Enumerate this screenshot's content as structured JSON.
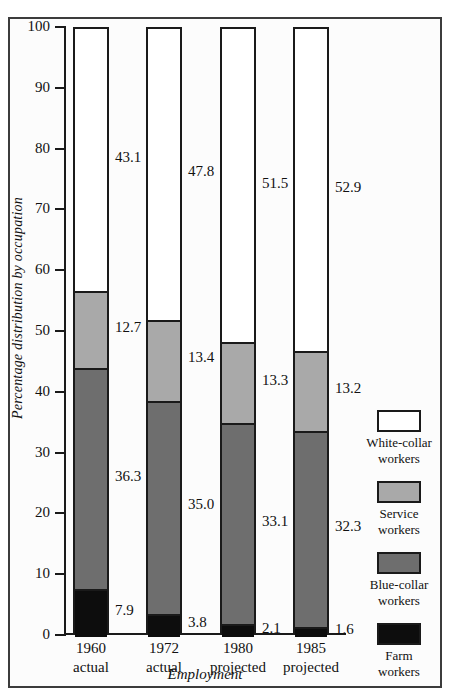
{
  "scan_artifact_text": "",
  "chart_data": {
    "type": "bar",
    "subtype": "stacked-100-percent",
    "title": "",
    "xlabel": "Employment",
    "ylabel": "Percentage distribution by occupation",
    "ylim": [
      0,
      100
    ],
    "ytick_labels": [
      "100",
      "90",
      "80",
      "70",
      "60",
      "50",
      "40",
      "30",
      "20",
      "10",
      "0"
    ],
    "ytick_values": [
      100,
      90,
      80,
      70,
      60,
      50,
      40,
      30,
      20,
      10,
      0
    ],
    "grid": false,
    "legend_position": "right",
    "categories": [
      "1960 actual",
      "1972 actual",
      "1980 projected",
      "1985 projected"
    ],
    "category_lines": [
      [
        "1960",
        "actual"
      ],
      [
        "1972",
        "actual"
      ],
      [
        "1980",
        "projected"
      ],
      [
        "1985",
        "projected"
      ]
    ],
    "series": [
      {
        "name": "White-collar workers",
        "legend_lines": [
          "White-collar",
          "workers"
        ],
        "color": "#ffffff",
        "values": [
          43.1,
          47.8,
          51.5,
          52.9
        ],
        "labels": [
          "43.1",
          "47.8",
          "51.5",
          "52.9"
        ]
      },
      {
        "name": "Service workers",
        "legend_lines": [
          "Service",
          "workers"
        ],
        "color": "#a9a9a9",
        "values": [
          12.7,
          13.4,
          13.3,
          13.2
        ],
        "labels": [
          "12.7",
          "13.4",
          "13.3",
          "13.2"
        ]
      },
      {
        "name": "Blue-collar workers",
        "legend_lines": [
          "Blue-collar",
          "workers"
        ],
        "color": "#6e6e6e",
        "values": [
          36.3,
          35.0,
          33.1,
          32.3
        ],
        "labels": [
          "36.3",
          "35.0",
          "33.1",
          "32.3"
        ]
      },
      {
        "name": "Farm workers",
        "legend_lines": [
          "Farm",
          "workers"
        ],
        "color": "#0d0d0d",
        "values": [
          7.9,
          3.8,
          2.1,
          1.6
        ],
        "labels": [
          "7.9",
          "3.8",
          "2.1",
          "1.6"
        ]
      }
    ]
  }
}
